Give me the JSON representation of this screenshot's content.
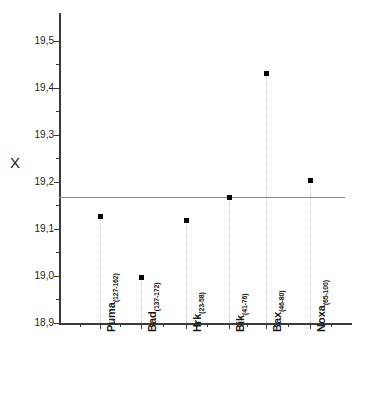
{
  "chart_data": {
    "type": "scatter",
    "title": "",
    "subtitle": "",
    "xlabel": "",
    "ylabel": "X",
    "ylim": [
      18.9,
      19.5
    ],
    "ytick_labels": [
      "18,9",
      "19,0",
      "19,1",
      "19,2",
      "19,3",
      "19,4",
      "19,5"
    ],
    "ytick_values": [
      18.9,
      19.0,
      19.1,
      19.2,
      19.3,
      19.4,
      19.5
    ],
    "decimal_separator": ",",
    "grid": false,
    "legend": "none",
    "categories": [
      "Puma",
      "Bad",
      "Hrk",
      "Bik",
      "Bax",
      "Noxa"
    ],
    "category_subscripts": [
      "(127-162)",
      "(137-172)",
      "(23-58)",
      "(41-76)",
      "(46-80)",
      "(65-100)"
    ],
    "category_labels": [
      "Puma(127-162)",
      "Bad(137-172)",
      "Hrk(23-58)",
      "Bik(41-76)",
      "Bax(46-80)",
      "Noxa(65-100)"
    ],
    "values": [
      19.128,
      18.998,
      19.12,
      19.168,
      19.432,
      19.205
    ],
    "reference_line": {
      "value": 19.168,
      "label": "",
      "color": "#8a8a8a"
    },
    "marker": {
      "shape": "square",
      "color": "#000000",
      "size_px": 5
    },
    "drop_lines": {
      "style": "dotted",
      "color": "#c9c9c9"
    },
    "axis_color": "#3a3a3a"
  },
  "colors": {
    "background": "#ffffff",
    "axis": "#3a3a3a",
    "marker": "#000000",
    "reference": "#8a8a8a",
    "dropline": "#c9c9c9",
    "text": "#1a1a1a"
  }
}
